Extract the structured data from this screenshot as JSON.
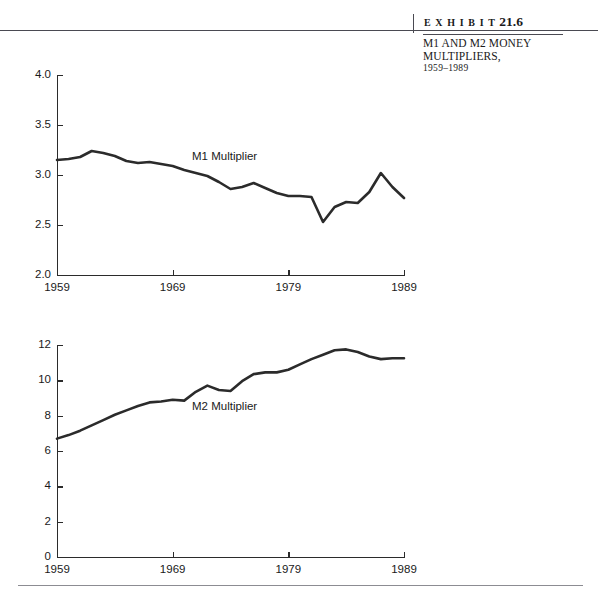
{
  "header": {
    "exhibit_word": "E X H I B I T",
    "exhibit_number": "21.6",
    "caption_line1": "M1 AND M2 MONEY",
    "caption_line2": "MULTIPLIERS,",
    "caption_years": "1959–1989"
  },
  "chart_data": [
    {
      "type": "line",
      "title": "M1 Multiplier",
      "xlabel": "",
      "ylabel": "",
      "xlim": [
        1959,
        1989
      ],
      "ylim": [
        2.0,
        4.0
      ],
      "grid": false,
      "legend": "inline-annotation",
      "series_label": "M1 Multiplier",
      "xticks": [
        "1959",
        "1969",
        "1979",
        "1989"
      ],
      "xtick_values": [
        1959,
        1969,
        1979,
        1989
      ],
      "yticks": [
        "2.0",
        "2.5",
        "3.0",
        "3.5",
        "4.0"
      ],
      "ytick_values": [
        2.0,
        2.5,
        3.0,
        3.5,
        4.0
      ],
      "x": [
        1959,
        1960,
        1961,
        1962,
        1963,
        1964,
        1965,
        1966,
        1967,
        1968,
        1969,
        1970,
        1971,
        1972,
        1973,
        1974,
        1975,
        1976,
        1977,
        1978,
        1979,
        1980,
        1981,
        1982,
        1983,
        1984,
        1985,
        1986,
        1987,
        1988,
        1989
      ],
      "values": [
        3.15,
        3.16,
        3.18,
        3.24,
        3.22,
        3.19,
        3.14,
        3.12,
        3.13,
        3.11,
        3.09,
        3.05,
        3.02,
        2.99,
        2.93,
        2.86,
        2.88,
        2.92,
        2.87,
        2.82,
        2.79,
        2.79,
        2.78,
        2.53,
        2.68,
        2.73,
        2.72,
        2.83,
        3.02,
        2.88,
        2.77
      ]
    },
    {
      "type": "line",
      "title": "M2 Multiplier",
      "xlabel": "",
      "ylabel": "",
      "xlim": [
        1959,
        1989
      ],
      "ylim": [
        0,
        12
      ],
      "grid": false,
      "legend": "inline-annotation",
      "series_label": "M2 Multiplier",
      "xticks": [
        "1959",
        "1969",
        "1979",
        "1989"
      ],
      "xtick_values": [
        1959,
        1969,
        1979,
        1989
      ],
      "yticks": [
        "0",
        "2",
        "4",
        "6",
        "8",
        "10",
        "12"
      ],
      "ytick_values": [
        0,
        2,
        4,
        6,
        8,
        10,
        12
      ],
      "x": [
        1959,
        1960,
        1961,
        1962,
        1963,
        1964,
        1965,
        1966,
        1967,
        1968,
        1969,
        1970,
        1971,
        1972,
        1973,
        1974,
        1975,
        1976,
        1977,
        1978,
        1979,
        1980,
        1981,
        1982,
        1983,
        1984,
        1985,
        1986,
        1987,
        1988,
        1989
      ],
      "values": [
        6.7,
        6.9,
        7.15,
        7.45,
        7.75,
        8.05,
        8.3,
        8.55,
        8.75,
        8.8,
        8.9,
        8.85,
        9.35,
        9.7,
        9.45,
        9.4,
        9.95,
        10.35,
        10.45,
        10.45,
        10.6,
        10.9,
        11.2,
        11.45,
        11.7,
        11.75,
        11.6,
        11.35,
        11.2,
        11.25,
        11.25
      ]
    }
  ]
}
